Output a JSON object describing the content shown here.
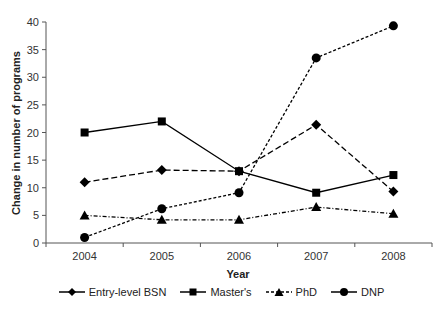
{
  "chart_data": {
    "type": "line",
    "title": "",
    "xlabel": "Year",
    "ylabel": "Change in number of programs",
    "categories": [
      "2004",
      "2005",
      "2006",
      "2007",
      "2008"
    ],
    "ylim": [
      0,
      40
    ],
    "yticks": [
      0,
      5,
      10,
      15,
      20,
      25,
      30,
      35,
      40
    ],
    "grid": false,
    "legend_position": "bottom",
    "series": [
      {
        "name": "Entry-level BSN",
        "marker": "diamond",
        "line": "dashed",
        "values": [
          11,
          13.2,
          13,
          21.4,
          9.3
        ]
      },
      {
        "name": "Master's",
        "marker": "square",
        "line": "solid",
        "values": [
          20,
          22,
          13,
          9.1,
          12.3
        ]
      },
      {
        "name": "PhD",
        "marker": "triangle",
        "line": "dash-dot",
        "values": [
          5,
          4.2,
          4.2,
          6.5,
          5.3
        ]
      },
      {
        "name": "DNP",
        "marker": "circle",
        "line": "dotted-dash",
        "values": [
          1,
          6.2,
          9.1,
          33.5,
          39.3
        ]
      }
    ]
  },
  "legend": {
    "items": [
      "Entry-level BSN",
      "Master's",
      "PhD",
      "DNP"
    ]
  },
  "colors": {
    "line": "#000000",
    "axis": "#555555"
  }
}
